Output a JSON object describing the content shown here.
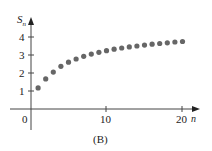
{
  "chart_data": {
    "type": "scatter",
    "title": "",
    "caption": "(B)",
    "xlabel": "n",
    "ylabel": "S_n",
    "xlim": [
      0,
      21
    ],
    "ylim": [
      0,
      4.6
    ],
    "x_ticks": [
      10,
      20
    ],
    "y_ticks": [
      1,
      2,
      3,
      4
    ],
    "origin_label": "0",
    "grid": false,
    "legend": null,
    "series": [
      {
        "name": "S_n",
        "color": "#666666",
        "x": [
          1,
          2,
          3,
          4,
          5,
          6,
          7,
          8,
          9,
          10,
          11,
          12,
          13,
          14,
          15,
          16,
          17,
          18,
          19,
          20
        ],
        "values": [
          1.17,
          1.67,
          2.05,
          2.37,
          2.6,
          2.78,
          2.93,
          3.05,
          3.15,
          3.24,
          3.32,
          3.39,
          3.45,
          3.5,
          3.55,
          3.6,
          3.64,
          3.68,
          3.72,
          3.75
        ]
      }
    ]
  },
  "labels": {
    "y_axis": "S",
    "y_axis_sub": "n",
    "x_axis": "n",
    "origin": "0",
    "x_tick_10": "10",
    "x_tick_20": "20",
    "y_tick_1": "1",
    "y_tick_2": "2",
    "y_tick_3": "3",
    "y_tick_4": "4",
    "caption": "(B)"
  }
}
